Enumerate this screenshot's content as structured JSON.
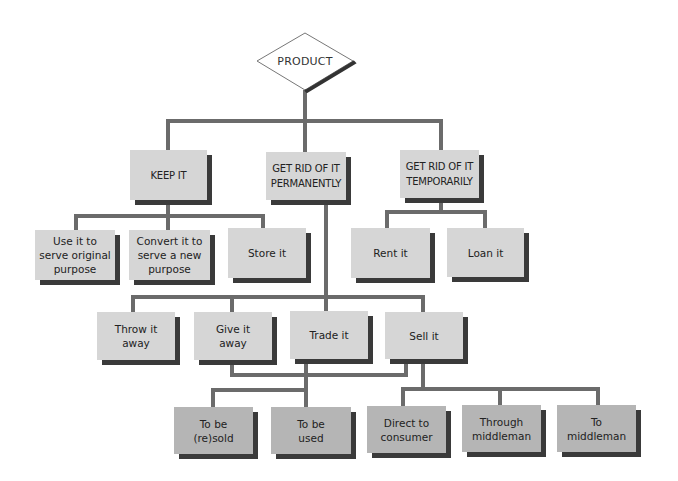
{
  "diagram": {
    "root": {
      "label": "PRODUCT",
      "shape": "diamond"
    },
    "level1": [
      {
        "id": "keep",
        "label": "KEEP IT"
      },
      {
        "id": "permanent",
        "label": "GET RID OF IT\nPERMANENTLY"
      },
      {
        "id": "temporary",
        "label": "GET RID OF IT\nTEMPORARILY"
      }
    ],
    "keep_children": [
      {
        "label": "Use it to\nserve original\npurpose"
      },
      {
        "label": "Convert it to\nserve a new\npurpose"
      },
      {
        "label": "Store it"
      }
    ],
    "temporary_children": [
      {
        "label": "Rent it"
      },
      {
        "label": "Loan it"
      }
    ],
    "permanent_children": [
      {
        "label": "Throw it\naway"
      },
      {
        "label": "Give it\naway"
      },
      {
        "label": "Trade it"
      },
      {
        "label": "Sell it"
      }
    ],
    "transfer_children": [
      {
        "label": "To be\n(re)sold"
      },
      {
        "label": "To be\nused"
      }
    ],
    "sell_children": [
      {
        "label": "Direct to\nconsumer"
      },
      {
        "label": "Through\nmiddleman"
      },
      {
        "label": "To\nmiddleman"
      }
    ]
  },
  "colors": {
    "box_light": "#d6d6d6",
    "box_dark": "#b5b5b5",
    "shadow": "#3a3a3a",
    "connector": "#6b6b6b"
  }
}
